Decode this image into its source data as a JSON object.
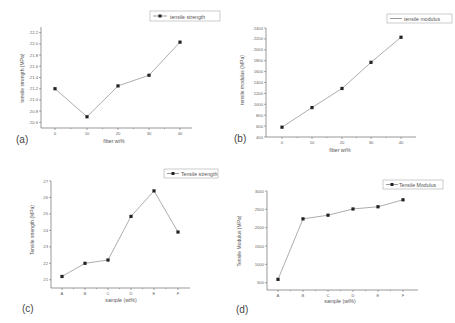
{
  "chart_data": [
    {
      "panel_label": "(a)",
      "type": "line",
      "title": "",
      "xlabel": "fiber wt%",
      "ylabel": "tensile strength (MPa)",
      "x": [
        0,
        10,
        20,
        30,
        40
      ],
      "series": [
        {
          "name": "tensile strength",
          "values": [
            21.2,
            20.7,
            21.25,
            21.44,
            22.03
          ],
          "marker": "square"
        }
      ],
      "xticks": [
        "0",
        "10",
        "20",
        "30",
        "40"
      ],
      "yticks": [
        "20.6",
        "20.8",
        "21.0",
        "21.2",
        "21.4",
        "21.6",
        "21.8",
        "22.0",
        "22.2"
      ],
      "xlim": [
        -5,
        45
      ],
      "ylim": [
        20.5,
        22.3
      ],
      "grid": false,
      "legend_position": "top-right"
    },
    {
      "panel_label": "(b)",
      "type": "line",
      "title": "",
      "xlabel": "fiber wt%",
      "ylabel": "tensile modulus (MPa)",
      "x": [
        0,
        10,
        20,
        30,
        40
      ],
      "series": [
        {
          "name": "tensile modulus",
          "values": [
            580,
            940,
            1290,
            1770,
            2230
          ],
          "marker": "square"
        }
      ],
      "xticks": [
        "0",
        "10",
        "20",
        "30",
        "40"
      ],
      "yticks": [
        "400",
        "600",
        "800",
        "1000",
        "1200",
        "1400",
        "1600",
        "1800",
        "2000",
        "2200",
        "2400"
      ],
      "xlim": [
        -5,
        45
      ],
      "ylim": [
        400,
        2400
      ],
      "grid": false,
      "legend_position": "top-right"
    },
    {
      "panel_label": "(c)",
      "type": "line",
      "title": "",
      "xlabel": "sample (wt%)",
      "ylabel": "Tensile strength (MPa)",
      "categories": [
        "A",
        "B",
        "C",
        "D",
        "E",
        "F"
      ],
      "series": [
        {
          "name": "Tensile strength",
          "values": [
            21.2,
            22.0,
            22.2,
            24.85,
            26.4,
            23.9
          ],
          "marker": "square"
        }
      ],
      "yticks": [
        "21",
        "22",
        "23",
        "24",
        "25",
        "26",
        "27"
      ],
      "ylim": [
        20.5,
        27
      ],
      "grid": false,
      "legend_position": "top-right"
    },
    {
      "panel_label": "(d)",
      "type": "line",
      "title": "",
      "xlabel": "sample (wt%)",
      "ylabel": "Tensile Modulus (MPa)",
      "categories": [
        "A",
        "B",
        "C",
        "D",
        "E",
        "F"
      ],
      "series": [
        {
          "name": "Tensile Modulus",
          "values": [
            590,
            2240,
            2340,
            2510,
            2570,
            2760
          ],
          "marker": "square"
        }
      ],
      "yticks": [
        "500",
        "1000",
        "1500",
        "2000",
        "2500",
        "3000"
      ],
      "ylim": [
        300,
        3000
      ],
      "grid": false,
      "legend_position": "top-right"
    }
  ],
  "panels": {
    "a": {
      "label": "(a)",
      "legend": "tensile strength",
      "xlabel": "fiber wt%",
      "ylabel": "tensile strength (MPa)"
    },
    "b": {
      "label": "(b)",
      "legend": "tensile modulus",
      "xlabel": "fiber wt%",
      "ylabel": "tensile modulus (MPa)"
    },
    "c": {
      "label": "(c)",
      "legend": "Tensile strength",
      "xlabel": "sample (wt%)",
      "ylabel": "Tensile strength (MPa)"
    },
    "d": {
      "label": "(d)",
      "legend": "Tensile Modulus",
      "xlabel": "sample (wt%)",
      "ylabel": "Tensile Modulus (MPa)"
    }
  },
  "colors": {
    "line": "#8a8a8a",
    "marker": "#222222",
    "axis": "#555555",
    "text": "#555555"
  }
}
